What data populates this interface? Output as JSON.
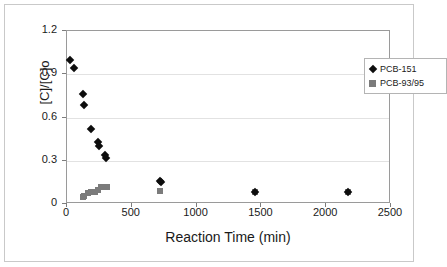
{
  "chart_data": {
    "type": "scatter",
    "title": "",
    "xlabel": "Reaction Time (min)",
    "ylabel": "[C]/[C]o",
    "xlim": [
      0,
      2500
    ],
    "ylim": [
      0,
      1.2
    ],
    "xticks": [
      0,
      500,
      1000,
      1500,
      2000,
      2500
    ],
    "yticks": [
      0,
      0.3,
      0.6,
      0.9,
      1.2
    ],
    "xtick_labels": [
      "0",
      "500",
      "1000",
      "1500",
      "2000",
      "2500"
    ],
    "ytick_labels": [
      "0",
      "0.3",
      "0.6",
      "0.9",
      "1.2"
    ],
    "grid": "horizontal",
    "legend_position": "top-right",
    "series": [
      {
        "name": "PCB-151",
        "marker": "diamond",
        "color": "#0d0d0d",
        "points": [
          {
            "x": 20,
            "y": 1.0
          },
          {
            "x": 55,
            "y": 0.94
          },
          {
            "x": 125,
            "y": 0.76
          },
          {
            "x": 135,
            "y": 0.69
          },
          {
            "x": 185,
            "y": 0.52
          },
          {
            "x": 240,
            "y": 0.43
          },
          {
            "x": 245,
            "y": 0.4
          },
          {
            "x": 295,
            "y": 0.34
          },
          {
            "x": 300,
            "y": 0.32
          },
          {
            "x": 720,
            "y": 0.16
          },
          {
            "x": 725,
            "y": 0.15
          },
          {
            "x": 1450,
            "y": 0.085
          },
          {
            "x": 2170,
            "y": 0.085
          }
        ]
      },
      {
        "name": "PCB-93/95",
        "marker": "square",
        "color": "#7b7b7b",
        "points": [
          {
            "x": 120,
            "y": 0.05
          },
          {
            "x": 130,
            "y": 0.055
          },
          {
            "x": 165,
            "y": 0.075
          },
          {
            "x": 185,
            "y": 0.08
          },
          {
            "x": 215,
            "y": 0.085
          },
          {
            "x": 240,
            "y": 0.095
          },
          {
            "x": 265,
            "y": 0.115
          },
          {
            "x": 290,
            "y": 0.12
          },
          {
            "x": 310,
            "y": 0.12
          },
          {
            "x": 720,
            "y": 0.09
          },
          {
            "x": 1450,
            "y": 0.08
          },
          {
            "x": 2170,
            "y": 0.08
          }
        ]
      }
    ]
  },
  "legend": {
    "entries": [
      {
        "label": "PCB-151",
        "marker": "diamond-icon"
      },
      {
        "label": "PCB-93/95",
        "marker": "square-icon"
      }
    ]
  },
  "colors": {
    "series1": "#0d0d0d",
    "series2": "#7b7b7b",
    "gridline": "#e2e2e2",
    "axis": "#9a9a9a",
    "text": "#1a1a1a",
    "background": "#ffffff",
    "figure_border": "#c9c9c9"
  }
}
